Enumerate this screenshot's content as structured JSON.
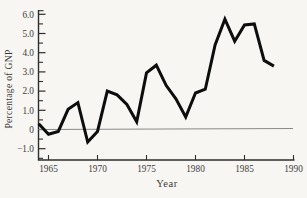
{
  "figure": {
    "y_axis_title": "Percentage of GNP",
    "x_axis_title": "Year"
  },
  "chart_data": {
    "type": "line",
    "title": "",
    "xlabel": "Year",
    "ylabel": "Percentage of GNP",
    "x": [
      1964,
      1965,
      1966,
      1967,
      1968,
      1969,
      1970,
      1971,
      1972,
      1973,
      1974,
      1975,
      1976,
      1977,
      1978,
      1979,
      1980,
      1981,
      1982,
      1983,
      1984,
      1985,
      1986,
      1987,
      1988
    ],
    "values": [
      0.3,
      -0.25,
      -0.1,
      1.05,
      1.4,
      -0.65,
      -0.1,
      2.0,
      1.8,
      1.3,
      0.4,
      2.95,
      3.35,
      2.3,
      1.6,
      0.65,
      1.9,
      2.1,
      4.4,
      5.75,
      4.6,
      5.45,
      5.5,
      3.6,
      3.3
    ],
    "x_ticks": {
      "values": [
        1965,
        1970,
        1975,
        1980,
        1985,
        1990
      ],
      "labels": [
        "1965",
        "1970",
        "1975",
        "1980",
        "1985",
        "1990"
      ]
    },
    "y_ticks": {
      "values": [
        6,
        5,
        4,
        3,
        2,
        1,
        0,
        -1
      ],
      "labels": [
        "6.0",
        "5.0",
        "4.0",
        "3.0",
        "2.0",
        "1.0",
        "0",
        "−1.0"
      ],
      "minor": [
        5.5,
        4.5,
        3.5,
        2.5,
        1.5,
        0.5,
        -0.5,
        -1.5
      ]
    },
    "xlim": [
      1964,
      1990
    ],
    "ylim": [
      -1.6,
      6.3
    ],
    "grid": "off",
    "legend": "none",
    "zero_line": true,
    "colors": {
      "series_line": "#0d0d0d",
      "axis": "#2e2e2e",
      "zero_line": "#8a8a8a",
      "text": "#3c3c3c",
      "background": "#f7f6f2"
    }
  }
}
